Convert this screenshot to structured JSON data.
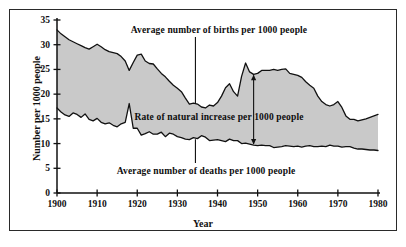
{
  "chart_data": {
    "type": "area",
    "title": "",
    "xlabel": "Year",
    "ylabel": "Number per 1000 people",
    "xlim": [
      1900,
      1980
    ],
    "ylim": [
      0,
      35
    ],
    "xticks": [
      1900,
      1910,
      1920,
      1930,
      1940,
      1950,
      1960,
      1970,
      1980
    ],
    "yticks": [
      0,
      5,
      10,
      15,
      20,
      25,
      30,
      35
    ],
    "grid": false,
    "legend_position": "inline-annotations",
    "fill_color": "#c9c9c9",
    "line_color": "#111111",
    "annotations": [
      {
        "text": "Average number of births per 1000 people",
        "target_series": "births",
        "leader_year": 1934.5
      },
      {
        "text": "Rate of natural increase per 1000 people",
        "target_series": "gap",
        "leader_year": 1949
      },
      {
        "text": "Average number of deaths per 1000 people",
        "target_series": "deaths",
        "leader_year": 1934.5
      }
    ],
    "x": [
      1900,
      1901,
      1902,
      1903,
      1904,
      1905,
      1906,
      1907,
      1908,
      1909,
      1910,
      1911,
      1912,
      1913,
      1914,
      1915,
      1916,
      1917,
      1918,
      1919,
      1920,
      1921,
      1922,
      1923,
      1924,
      1925,
      1926,
      1927,
      1928,
      1929,
      1930,
      1931,
      1932,
      1933,
      1934,
      1935,
      1936,
      1937,
      1938,
      1939,
      1940,
      1941,
      1942,
      1943,
      1944,
      1945,
      1946,
      1947,
      1948,
      1949,
      1950,
      1951,
      1952,
      1953,
      1954,
      1955,
      1956,
      1957,
      1958,
      1959,
      1960,
      1961,
      1962,
      1963,
      1964,
      1965,
      1966,
      1967,
      1968,
      1969,
      1970,
      1971,
      1972,
      1973,
      1974,
      1975,
      1976,
      1977,
      1978,
      1979,
      1980
    ],
    "series": [
      {
        "name": "Average number of births per 1000 people",
        "key": "births",
        "values": [
          33.0,
          32.2,
          31.6,
          31.0,
          30.6,
          30.2,
          29.8,
          29.4,
          29.1,
          29.6,
          30.1,
          29.6,
          29.0,
          28.6,
          28.4,
          28.2,
          27.6,
          26.7,
          24.8,
          26.4,
          27.9,
          28.1,
          26.7,
          26.2,
          26.1,
          25.1,
          24.2,
          23.5,
          22.6,
          21.8,
          21.2,
          20.5,
          19.2,
          18.0,
          18.2,
          18.0,
          17.4,
          17.2,
          17.8,
          17.6,
          18.3,
          19.6,
          21.3,
          22.1,
          20.5,
          19.6,
          23.6,
          26.3,
          24.5,
          24.0,
          24.2,
          24.8,
          24.8,
          24.8,
          25.0,
          24.8,
          25.0,
          25.1,
          24.2,
          24.0,
          23.8,
          23.4,
          22.5,
          21.8,
          21.2,
          19.6,
          18.5,
          17.9,
          17.6,
          17.9,
          18.5,
          17.3,
          15.6,
          14.9,
          14.9,
          14.6,
          14.8,
          15.0,
          15.3,
          15.6,
          15.9
        ]
      },
      {
        "name": "Average number of deaths per 1000 people",
        "key": "deaths",
        "values": [
          17.2,
          16.4,
          15.8,
          15.5,
          16.2,
          15.9,
          15.3,
          16.0,
          14.9,
          14.6,
          15.1,
          14.3,
          14.0,
          14.2,
          13.7,
          13.4,
          14.0,
          14.3,
          18.1,
          13.1,
          13.1,
          11.7,
          12.0,
          12.4,
          11.9,
          11.9,
          12.3,
          11.4,
          12.1,
          11.9,
          11.4,
          11.2,
          10.9,
          10.8,
          11.2,
          11.0,
          11.6,
          11.3,
          10.6,
          10.7,
          10.8,
          10.6,
          10.4,
          10.9,
          10.6,
          10.6,
          10.0,
          10.1,
          9.9,
          9.7,
          9.6,
          9.7,
          9.6,
          9.6,
          9.2,
          9.3,
          9.4,
          9.6,
          9.5,
          9.4,
          9.5,
          9.3,
          9.5,
          9.6,
          9.4,
          9.4,
          9.5,
          9.4,
          9.7,
          9.5,
          9.5,
          9.3,
          9.4,
          9.4,
          9.1,
          8.9,
          8.9,
          8.8,
          8.7,
          8.7,
          8.6
        ]
      }
    ]
  },
  "axis": {
    "y_label": "Number per 1000 people",
    "x_label": "Year",
    "y_ticks": [
      "0",
      "5",
      "10",
      "15",
      "20",
      "25",
      "30",
      "35"
    ],
    "x_ticks": [
      "1900",
      "1910",
      "1920",
      "1930",
      "1940",
      "1950",
      "1960",
      "1970",
      "1980"
    ]
  },
  "annotations": {
    "births": "Average number of births per 1000 people",
    "natural_increase": "Rate of natural increase per 1000 people",
    "deaths": "Average number of deaths per 1000 people"
  }
}
